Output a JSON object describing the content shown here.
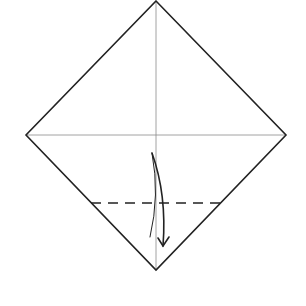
{
  "diagram": {
    "type": "origami-step",
    "paper": {
      "shape": "diamond",
      "vertices": {
        "top": [
          156,
          1
        ],
        "right": [
          286,
          135
        ],
        "bottom": [
          156,
          270
        ],
        "left": [
          26,
          135
        ]
      },
      "stroke": "#222222"
    },
    "creases": [
      {
        "name": "horizontal-center-crease",
        "from": [
          26,
          135
        ],
        "to": [
          286,
          135
        ],
        "color": "#888888"
      },
      {
        "name": "vertical-center-crease",
        "from": [
          156,
          1
        ],
        "to": [
          156,
          270
        ],
        "color": "#888888"
      }
    ],
    "fold_lines": [
      {
        "name": "valley-fold-line",
        "style": "dashed",
        "from": [
          91,
          203
        ],
        "to": [
          221,
          203
        ]
      }
    ],
    "arrows": [
      {
        "name": "fold-arrow",
        "direction": "down",
        "from": [
          152,
          153
        ],
        "to": [
          163,
          246
        ]
      }
    ]
  }
}
